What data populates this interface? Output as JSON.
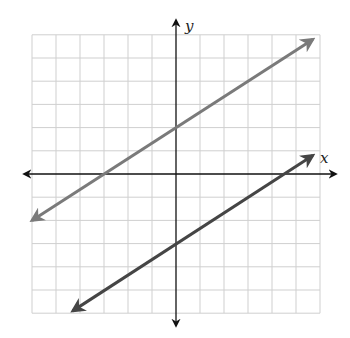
{
  "chart_data": {
    "type": "line",
    "title": "",
    "xlabel": "x",
    "ylabel": "y",
    "xlim": [
      -6,
      6
    ],
    "ylim": [
      -6,
      6
    ],
    "grid": true,
    "grid_step": 1,
    "tick_labels": false,
    "series": [
      {
        "name": "upper line",
        "equation": "y = (2/3)x + 2",
        "slope": 0.667,
        "intercept": 2,
        "color": "#7a7a7a",
        "x": [
          -6,
          5.7
        ],
        "y": [
          -2,
          5.8
        ]
      },
      {
        "name": "lower line",
        "equation": "y = (2/3)x - 3",
        "slope": 0.667,
        "intercept": -3,
        "color": "#454545",
        "x": [
          -4.3,
          5.7
        ],
        "y": [
          -5.9,
          0.8
        ]
      }
    ]
  },
  "axes": {
    "x_label": "x",
    "y_label": "y",
    "axis_color": "#111111",
    "grid_color": "#cfcfcf"
  },
  "layout": {
    "origin_px": [
      176,
      174
    ],
    "unit_px_x": 24,
    "unit_px_y": 23.2
  }
}
